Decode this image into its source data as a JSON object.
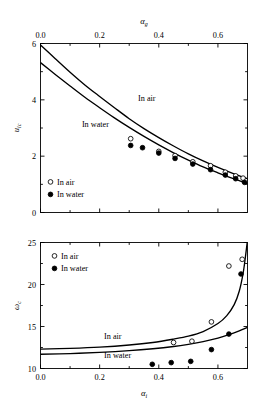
{
  "figure": {
    "background": "#ffffff",
    "line_color": "#000000",
    "marker_open_label": "In air",
    "marker_filled_label": "In water"
  },
  "chart_data": [
    {
      "id": "top",
      "type": "line",
      "title": "",
      "xlabel": "αg",
      "xlabel_base": "α",
      "xlabel_sub": "g",
      "xlabel_position": "top",
      "ylabel": "uic",
      "ylabel_base": "u",
      "ylabel_sub": "ic",
      "xlim": [
        0.0,
        0.7
      ],
      "ylim": [
        0,
        6
      ],
      "xticks": [
        0.0,
        0.2,
        0.4,
        0.6
      ],
      "xticklabels": [
        "0.0",
        "0.2",
        "0.4",
        "0.6"
      ],
      "xminorticks": [
        0.1,
        0.3,
        0.5,
        0.7
      ],
      "yticks": [
        0,
        2,
        4,
        6
      ],
      "yticklabels": [
        "0",
        "2",
        "4",
        "6"
      ],
      "yminorticks": [
        1,
        3,
        5
      ],
      "grid": false,
      "legend_position": "lower-left",
      "legend": [
        "In air",
        "In water"
      ],
      "annotations": [
        {
          "text": "In air",
          "x": 0.33,
          "y": 3.95
        },
        {
          "text": "In water",
          "x": 0.14,
          "y": 3.05
        }
      ],
      "series": [
        {
          "name": "In air",
          "kind": "curve",
          "x": [
            0.0,
            0.05,
            0.1,
            0.15,
            0.2,
            0.25,
            0.3,
            0.35,
            0.4,
            0.45,
            0.5,
            0.55,
            0.6,
            0.65,
            0.7
          ],
          "y": [
            5.95,
            5.46,
            4.98,
            4.53,
            4.12,
            3.72,
            3.33,
            2.98,
            2.66,
            2.36,
            2.08,
            1.83,
            1.6,
            1.39,
            1.2
          ]
        },
        {
          "name": "In water",
          "kind": "curve",
          "x": [
            0.0,
            0.05,
            0.1,
            0.15,
            0.2,
            0.25,
            0.3,
            0.35,
            0.4,
            0.45,
            0.5,
            0.55,
            0.6,
            0.65,
            0.7
          ],
          "y": [
            5.32,
            4.9,
            4.49,
            4.09,
            3.72,
            3.36,
            3.02,
            2.7,
            2.4,
            2.12,
            1.86,
            1.62,
            1.41,
            1.21,
            1.03
          ]
        },
        {
          "name": "In air",
          "kind": "points",
          "marker": "open-circle",
          "x": [
            0.305,
            0.4,
            0.455,
            0.515,
            0.575,
            0.625,
            0.66,
            0.685
          ],
          "y": [
            2.62,
            2.17,
            2.02,
            1.8,
            1.66,
            1.43,
            1.3,
            1.22
          ]
        },
        {
          "name": "In water",
          "kind": "points",
          "marker": "filled-circle",
          "x": [
            0.305,
            0.345,
            0.4,
            0.455,
            0.515,
            0.575,
            0.625,
            0.66,
            0.69
          ],
          "y": [
            2.38,
            2.3,
            2.11,
            1.92,
            1.72,
            1.52,
            1.33,
            1.2,
            1.07
          ]
        }
      ]
    },
    {
      "id": "bottom",
      "type": "line",
      "title": "",
      "xlabel": "αi",
      "xlabel_base": "α",
      "xlabel_sub": "i",
      "xlabel_position": "bottom",
      "ylabel": "ωc",
      "ylabel_base": "ω",
      "ylabel_sub": "c",
      "xlim": [
        0.0,
        0.7
      ],
      "ylim": [
        10,
        25
      ],
      "xticks": [
        0.0,
        0.2,
        0.4,
        0.6
      ],
      "xticklabels": [
        "0.0",
        "0.2",
        "0.4",
        "0.6"
      ],
      "xminorticks": [
        0.1,
        0.3,
        0.5,
        0.7
      ],
      "yticks": [
        10,
        15,
        20,
        25
      ],
      "yticklabels": [
        "10",
        "15",
        "20",
        "25"
      ],
      "yminorticks": [
        12.5,
        17.5,
        22.5
      ],
      "grid": false,
      "legend_position": "upper-left",
      "legend": [
        "In air",
        "In water"
      ],
      "annotations": [
        {
          "text": "In air",
          "x": 0.215,
          "y": 13.55
        },
        {
          "text": "In water",
          "x": 0.215,
          "y": 11.25
        }
      ],
      "series": [
        {
          "name": "In air",
          "kind": "curve",
          "x": [
            0.0,
            0.1,
            0.2,
            0.3,
            0.38,
            0.45,
            0.5,
            0.55,
            0.6,
            0.63,
            0.655,
            0.672,
            0.685,
            0.693,
            0.699
          ],
          "y": [
            12.3,
            12.4,
            12.55,
            12.8,
            13.1,
            13.5,
            13.85,
            14.4,
            15.35,
            16.3,
            17.6,
            19.2,
            21.3,
            23.3,
            25.0
          ]
        },
        {
          "name": "In water",
          "kind": "curve",
          "x": [
            0.0,
            0.1,
            0.2,
            0.3,
            0.38,
            0.45,
            0.5,
            0.55,
            0.6,
            0.64,
            0.67,
            0.7
          ],
          "y": [
            11.7,
            11.78,
            11.92,
            12.12,
            12.35,
            12.62,
            12.88,
            13.2,
            13.62,
            14.05,
            14.45,
            14.9
          ]
        },
        {
          "name": "In air",
          "kind": "points",
          "marker": "open-circle",
          "x": [
            0.45,
            0.512,
            0.578,
            0.637,
            0.682
          ],
          "y": [
            13.1,
            13.25,
            15.55,
            22.2,
            23.0
          ]
        },
        {
          "name": "In water",
          "kind": "points",
          "marker": "filled-circle",
          "x": [
            0.378,
            0.442,
            0.508,
            0.578,
            0.637,
            0.678
          ],
          "y": [
            10.5,
            10.7,
            10.85,
            12.25,
            14.1,
            21.25
          ]
        }
      ]
    }
  ]
}
